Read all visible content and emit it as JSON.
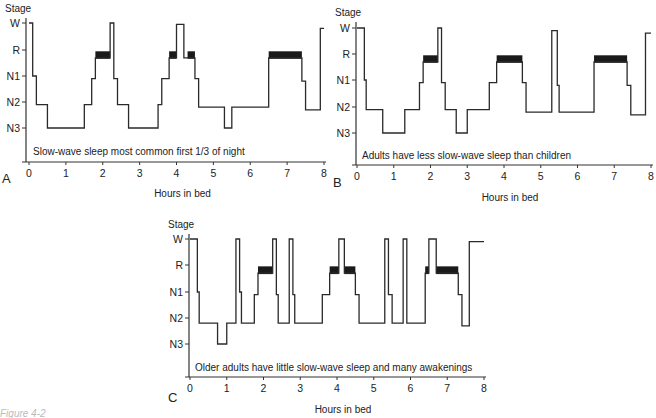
{
  "figure_caption": "Figure 4-2",
  "chart_data": [
    {
      "type": "line",
      "subtype": "step-hypnogram",
      "panel": "A",
      "title": "",
      "annotation": "Slow-wave sleep most common first 1/3 of night",
      "xlabel": "Hours in bed",
      "ylabel": "Stage",
      "xlim": [
        0,
        8
      ],
      "x_ticks": [
        "0",
        "1",
        "2",
        "3",
        "4",
        "5",
        "6",
        "7",
        "8"
      ],
      "y_categories": [
        "W",
        "R",
        "N1",
        "N2",
        "N3"
      ],
      "grid": false,
      "layout": {
        "x0": 29,
        "x8": 324,
        "y_axis_x": 26,
        "y_levels": [
          23,
          50,
          76,
          102,
          128
        ],
        "x_axis_y": 162,
        "stage_label_y": 8,
        "panel_label_x": 2,
        "panel_label_y": 183,
        "xlabel_y": 193,
        "note_x": 33,
        "note_y": 155,
        "y_axis_top": 18
      },
      "steps": [
        [
          0,
          0
        ],
        [
          0.1,
          2
        ],
        [
          0.2,
          3.1
        ],
        [
          0.5,
          4
        ],
        [
          1.5,
          3.1
        ],
        [
          1.7,
          2.1
        ],
        [
          1.8,
          1.3
        ],
        [
          2.2,
          0
        ],
        [
          2.3,
          2.1
        ],
        [
          2.4,
          3.1
        ],
        [
          2.7,
          4.05
        ],
        [
          3.5,
          3.1
        ],
        [
          3.6,
          2.1
        ],
        [
          3.8,
          1.3
        ],
        [
          4.0,
          0.05
        ],
        [
          4.2,
          1.3
        ],
        [
          4.5,
          2.1
        ],
        [
          4.6,
          3.2
        ],
        [
          5.3,
          4.1
        ],
        [
          5.5,
          3.2
        ],
        [
          6.5,
          1.3
        ],
        [
          7.4,
          2.2
        ],
        [
          7.5,
          3.3
        ],
        [
          7.9,
          0.2
        ],
        [
          8.0,
          0.2
        ]
      ],
      "rem_bands": [
        [
          1.8,
          2.2
        ],
        [
          3.8,
          4.0
        ],
        [
          4.3,
          4.5
        ],
        [
          6.5,
          7.4
        ]
      ]
    },
    {
      "type": "line",
      "subtype": "step-hypnogram",
      "panel": "B",
      "annotation": "Adults have less slow-wave sleep than children",
      "xlabel": "Hours in bed",
      "ylabel": "Stage",
      "xlim": [
        0,
        8
      ],
      "x_ticks": [
        "0",
        "1",
        "2",
        "3",
        "4",
        "5",
        "6",
        "7",
        "8"
      ],
      "y_categories": [
        "W",
        "R",
        "N1",
        "N2",
        "N3"
      ],
      "grid": false,
      "layout": {
        "x0": 357,
        "x8": 651,
        "y_axis_x": 356,
        "y_levels": [
          28,
          54,
          80,
          107,
          133
        ],
        "x_axis_y": 165,
        "stage_label_y": 12,
        "panel_label_x": 333,
        "panel_label_y": 187,
        "xlabel_y": 197,
        "note_x": 362,
        "note_y": 159,
        "y_axis_top": 22
      },
      "steps": [
        [
          0,
          0
        ],
        [
          0.2,
          2
        ],
        [
          0.25,
          3.1
        ],
        [
          0.7,
          4
        ],
        [
          1.3,
          3.1
        ],
        [
          1.7,
          2.1
        ],
        [
          1.8,
          1.3
        ],
        [
          2.2,
          0
        ],
        [
          2.3,
          2.1
        ],
        [
          2.4,
          3.1
        ],
        [
          2.7,
          4.1
        ],
        [
          3.0,
          3.1
        ],
        [
          3.6,
          2.1
        ],
        [
          3.8,
          1.3
        ],
        [
          4.5,
          2.1
        ],
        [
          4.6,
          3.2
        ],
        [
          5.3,
          0.1
        ],
        [
          5.45,
          2.2
        ],
        [
          5.5,
          3.2
        ],
        [
          6.45,
          1.3
        ],
        [
          7.35,
          2.2
        ],
        [
          7.45,
          3.3
        ],
        [
          7.85,
          0.2
        ],
        [
          8.0,
          0.2
        ]
      ],
      "rem_bands": [
        [
          1.8,
          2.2
        ],
        [
          3.8,
          4.5
        ],
        [
          6.45,
          7.35
        ]
      ]
    },
    {
      "type": "line",
      "subtype": "step-hypnogram",
      "panel": "C",
      "annotation": "Older adults have little slow-wave sleep and many awakenings",
      "xlabel": "Hours in bed",
      "ylabel": "Stage",
      "xlim": [
        0,
        8
      ],
      "x_ticks": [
        "0",
        "1",
        "2",
        "3",
        "4",
        "5",
        "6",
        "7",
        "8"
      ],
      "y_categories": [
        "W",
        "R",
        "N1",
        "N2",
        "N3"
      ],
      "grid": false,
      "layout": {
        "x0": 190,
        "x8": 484,
        "y_axis_x": 189,
        "y_levels": [
          239,
          265,
          292,
          318,
          344
        ],
        "x_axis_y": 377,
        "stage_label_y": 224,
        "panel_label_x": 168,
        "panel_label_y": 402,
        "xlabel_y": 409,
        "note_x": 195,
        "note_y": 371,
        "y_axis_top": 234
      },
      "steps": [
        [
          0,
          0
        ],
        [
          0.2,
          2
        ],
        [
          0.25,
          3.2
        ],
        [
          0.75,
          4.1
        ],
        [
          1.0,
          3.2
        ],
        [
          1.25,
          0
        ],
        [
          1.35,
          2
        ],
        [
          1.4,
          3.2
        ],
        [
          1.75,
          2.1
        ],
        [
          1.85,
          1.3
        ],
        [
          2.25,
          0
        ],
        [
          2.35,
          2.1
        ],
        [
          2.4,
          3.2
        ],
        [
          2.7,
          0
        ],
        [
          2.8,
          2.1
        ],
        [
          2.85,
          3.2
        ],
        [
          3.6,
          2.1
        ],
        [
          3.8,
          1.3
        ],
        [
          4.05,
          0
        ],
        [
          4.2,
          1.3
        ],
        [
          4.5,
          2.1
        ],
        [
          4.6,
          3.2
        ],
        [
          5.3,
          0
        ],
        [
          5.4,
          2.1
        ],
        [
          5.5,
          3.2
        ],
        [
          5.8,
          0
        ],
        [
          5.9,
          3.2
        ],
        [
          6.4,
          1.3
        ],
        [
          6.5,
          0
        ],
        [
          6.7,
          1.3
        ],
        [
          7.3,
          2.1
        ],
        [
          7.4,
          3.3
        ],
        [
          7.6,
          0.1
        ],
        [
          8.0,
          0.1
        ]
      ],
      "rem_bands": [
        [
          1.85,
          2.25
        ],
        [
          3.8,
          4.05
        ],
        [
          4.2,
          4.5
        ],
        [
          6.4,
          6.5
        ],
        [
          6.7,
          7.3
        ]
      ]
    }
  ]
}
